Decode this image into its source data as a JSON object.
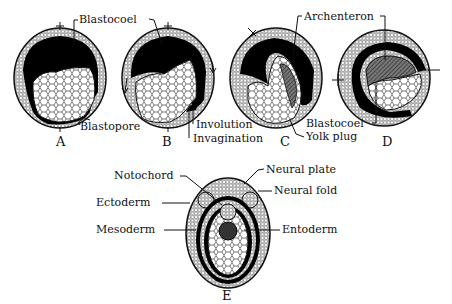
{
  "figure": {
    "panels": [
      {
        "id": "A",
        "letter": "A",
        "labels": {
          "blastocoel": "Blastocoel",
          "blastopore": "Blastopore"
        }
      },
      {
        "id": "B",
        "letter": "B",
        "labels": {
          "involution": "Involution",
          "invagination": "Invagination"
        }
      },
      {
        "id": "C",
        "letter": "C",
        "labels": {
          "archenteron": "Archenteron",
          "yolk_plug": "Yolk plug"
        }
      },
      {
        "id": "D",
        "letter": "D",
        "labels": {
          "blastocoel": "Blastocoel"
        }
      },
      {
        "id": "E",
        "letter": "E",
        "labels": {
          "notochord": "Notochord",
          "neural_plate": "Neural plate",
          "neural_fold": "Neural fold",
          "ectoderm": "Ectoderm",
          "mesoderm": "Mesoderm",
          "entoderm": "Entoderm"
        }
      }
    ],
    "colors": {
      "ink": "#111111",
      "background": "#ffffff",
      "hatch": "#555555"
    }
  }
}
